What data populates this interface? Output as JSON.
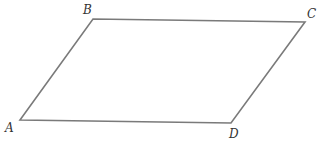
{
  "diagram": {
    "type": "parallelogram",
    "stroke_color": "#7a7a7a",
    "vertices": [
      {
        "label": "A",
        "x": 20,
        "y": 120,
        "lx": 5,
        "ly": 132
      },
      {
        "label": "B",
        "x": 93,
        "y": 19,
        "lx": 83,
        "ly": 14
      },
      {
        "label": "C",
        "x": 305,
        "y": 22,
        "lx": 307,
        "ly": 18
      },
      {
        "label": "D",
        "x": 231,
        "y": 123,
        "lx": 229,
        "ly": 138
      }
    ]
  }
}
